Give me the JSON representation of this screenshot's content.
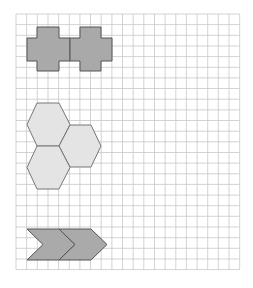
{
  "grid": {
    "origin_x": 16,
    "origin_y": 14,
    "cell": 10.65,
    "cols": 21,
    "rows": 24,
    "line_color": "#c8c8c8"
  },
  "shapes": [
    {
      "name": "cross-tile-1",
      "type": "cross",
      "fill": "#a9a9a9",
      "stroke": "#555555"
    },
    {
      "name": "cross-tile-2",
      "type": "cross",
      "fill": "#a9a9a9",
      "stroke": "#555555"
    },
    {
      "name": "hexagon-tile-1",
      "type": "hexagon",
      "fill": "#e4e4e4",
      "stroke": "#777777"
    },
    {
      "name": "hexagon-tile-2",
      "type": "hexagon",
      "fill": "#e4e4e4",
      "stroke": "#777777"
    },
    {
      "name": "hexagon-tile-3",
      "type": "hexagon",
      "fill": "#e4e4e4",
      "stroke": "#777777"
    },
    {
      "name": "chevron-tile-1",
      "type": "chevron",
      "fill": "#aaaaaa",
      "stroke": "#555555"
    },
    {
      "name": "chevron-tile-2",
      "type": "chevron",
      "fill": "#aaaaaa",
      "stroke": "#555555"
    }
  ]
}
